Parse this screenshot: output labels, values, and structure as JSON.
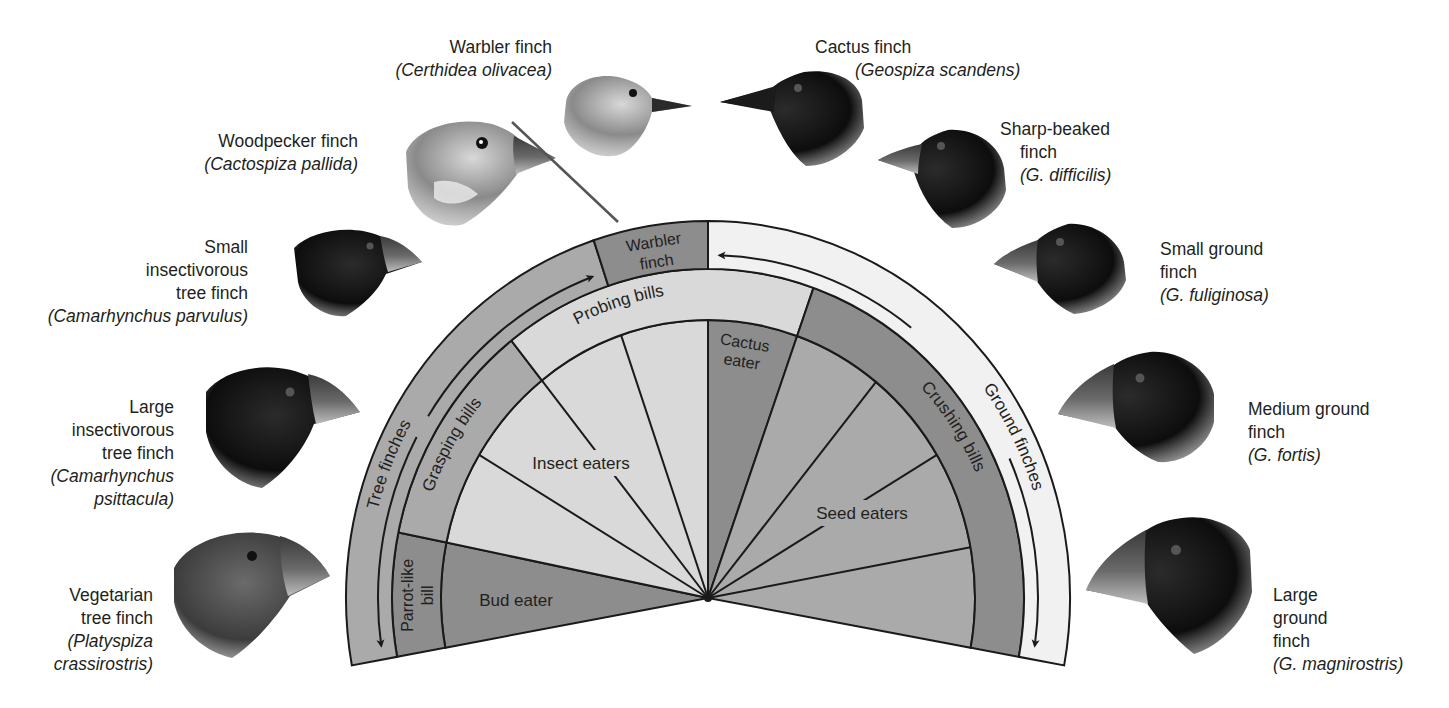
{
  "diagram": {
    "center": {
      "x": 708,
      "y": 598
    },
    "rings": {
      "outer": {
        "rx": 362,
        "ry": 377
      },
      "ring1_inner": {
        "rx": 316,
        "ry": 329
      },
      "ring2_inner": {
        "rx": 267,
        "ry": 278
      }
    },
    "colors": {
      "dark": "#8d8d8d",
      "medium": "#aaaaaa",
      "light": "#d9d9d9",
      "pale": "#f1f1f1",
      "stroke": "#1a1a1a",
      "text": "#231f20"
    },
    "outer_band": [
      {
        "id": "tree-finches",
        "label": "Tree finches",
        "from": 108.4,
        "to": 190.3,
        "fill": "medium"
      },
      {
        "id": "warbler-finch",
        "label_lines": [
          "Warbler",
          "finch"
        ],
        "from": 90,
        "to": 108.4,
        "fill": "dark"
      },
      {
        "id": "ground-finches",
        "label": "Ground finches",
        "from": -10.3,
        "to": 90,
        "fill": "pale"
      }
    ],
    "middle_band": [
      {
        "id": "parrot-like-bill",
        "label_lines": [
          "Parrot-like",
          "bill"
        ],
        "from": 168.5,
        "to": 190.3,
        "fill": "dark"
      },
      {
        "id": "grasping-bills",
        "label": "Grasping bills",
        "from": 128.5,
        "to": 168.5,
        "fill": "medium"
      },
      {
        "id": "probing-bills",
        "label": "Probing bills",
        "from": 70.5,
        "to": 128.5,
        "fill": "light"
      },
      {
        "id": "crushing-bills",
        "label": "Crushing bills",
        "from": -10.3,
        "to": 70.5,
        "fill": "dark"
      }
    ],
    "inner_sectors": [
      {
        "id": "bud-eater",
        "label": "Bud eater",
        "from": 168.5,
        "to": 190.3,
        "fill": "dark"
      },
      {
        "id": "insect-eaters",
        "label": "Insect eaters",
        "from": 90,
        "to": 168.5,
        "fill": "light",
        "spokes": [
          109,
          128.5,
          149
        ]
      },
      {
        "id": "cactus-eater",
        "label_lines": [
          "Cactus",
          "eater"
        ],
        "from": 70.5,
        "to": 90,
        "fill": "dark"
      },
      {
        "id": "seed-eaters",
        "label": "Seed eaters",
        "from": -10.3,
        "to": 70.5,
        "fill": "medium",
        "spokes": [
          51,
          31,
          10.5
        ]
      }
    ],
    "arrows": [
      {
        "id": "tree-finches-arrow",
        "band": "outer"
      },
      {
        "id": "ground-finches-arrow",
        "band": "outer"
      }
    ]
  },
  "finches": [
    {
      "id": "warbler-finch",
      "common": "Warbler finch",
      "scientific": "(Certhidea olivacea)"
    },
    {
      "id": "woodpecker-finch",
      "common": "Woodpecker finch",
      "scientific": "(Cactospiza pallida)"
    },
    {
      "id": "small-insectivorous-tree-finch",
      "common_lines": [
        "Small",
        "insectivorous",
        "tree finch"
      ],
      "scientific": "(Camarhynchus parvulus)"
    },
    {
      "id": "large-insectivorous-tree-finch",
      "common_lines": [
        "Large",
        "insectivorous",
        "tree finch"
      ],
      "scientific_lines": [
        "(Camarhynchus",
        "psittacula)"
      ]
    },
    {
      "id": "vegetarian-tree-finch",
      "common_lines": [
        "Vegetarian",
        "tree finch"
      ],
      "scientific_lines": [
        "(Platyspiza",
        "crassirostris)"
      ]
    },
    {
      "id": "cactus-finch",
      "common": "Cactus finch",
      "scientific": "(Geospiza scandens)"
    },
    {
      "id": "sharp-beaked-finch",
      "common_lines": [
        "Sharp-beaked",
        "finch"
      ],
      "scientific": "(G. difficilis)"
    },
    {
      "id": "small-ground-finch",
      "common_lines": [
        "Small ground",
        "finch"
      ],
      "scientific": "(G. fuliginosa)"
    },
    {
      "id": "medium-ground-finch",
      "common_lines": [
        "Medium ground",
        "finch"
      ],
      "scientific": "(G. fortis)"
    },
    {
      "id": "large-ground-finch",
      "common_lines": [
        "Large",
        "ground",
        "finch"
      ],
      "scientific": "(G. magnirostris)"
    }
  ]
}
